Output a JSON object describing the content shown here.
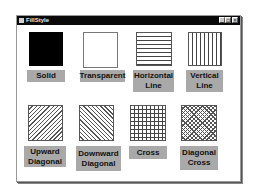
{
  "window": {
    "title": "FillStyle",
    "buttons": {
      "minimize": "_",
      "maximize": "□",
      "close": "×"
    }
  },
  "fill_styles": [
    {
      "id": "solid",
      "label_line1": "Solid",
      "label_line2": ""
    },
    {
      "id": "transparent",
      "label_line1": "Transparent",
      "label_line2": ""
    },
    {
      "id": "horizontal",
      "label_line1": "Horizontal",
      "label_line2": "Line"
    },
    {
      "id": "vertical",
      "label_line1": "Vertical",
      "label_line2": "Line"
    },
    {
      "id": "upward",
      "label_line1": "Upward",
      "label_line2": "Diagonal"
    },
    {
      "id": "downward",
      "label_line1": "Downward",
      "label_line2": "Diagonal"
    },
    {
      "id": "cross",
      "label_line1": "Cross",
      "label_line2": ""
    },
    {
      "id": "diagcross",
      "label_line1": "Diagonal",
      "label_line2": "Cross"
    }
  ],
  "colors": {
    "titlebar": "#0a0a0a",
    "label_bg": "#a9a9a9",
    "pattern": "#444444"
  }
}
